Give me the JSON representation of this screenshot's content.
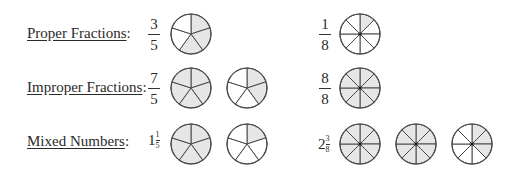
{
  "rows": [
    {
      "label": "Proper Fractions",
      "colon": ":",
      "left": {
        "type": "fraction",
        "numerator": "3",
        "denominator": "5",
        "pies": [
          {
            "slices": 5,
            "shaded": 3
          }
        ]
      },
      "right": {
        "type": "fraction",
        "numerator": "1",
        "denominator": "8",
        "pies": [
          {
            "slices": 8,
            "shaded": 1
          }
        ]
      }
    },
    {
      "label": "Improper Fractions",
      "colon": ":",
      "left": {
        "type": "fraction",
        "numerator": "7",
        "denominator": "5",
        "pies": [
          {
            "slices": 5,
            "shaded": 5
          },
          {
            "slices": 5,
            "shaded": 2
          }
        ]
      },
      "right": {
        "type": "fraction",
        "numerator": "8",
        "denominator": "8",
        "pies": [
          {
            "slices": 8,
            "shaded": 8
          }
        ]
      }
    },
    {
      "label": "Mixed Numbers",
      "colon": ":",
      "left": {
        "type": "mixed",
        "whole": "1",
        "numerator": "1",
        "denominator": "5",
        "pies": [
          {
            "slices": 5,
            "shaded": 5
          },
          {
            "slices": 5,
            "shaded": 1
          }
        ]
      },
      "right": {
        "type": "mixed",
        "whole": "2",
        "numerator": "3",
        "denominator": "8",
        "pies": [
          {
            "slices": 8,
            "shaded": 8
          },
          {
            "slices": 8,
            "shaded": 8
          },
          {
            "slices": 8,
            "shaded": 3
          }
        ]
      }
    }
  ],
  "colors": {
    "shaded": "#e6e6e6",
    "unshaded": "#ffffff",
    "stroke": "#4a4a4a"
  }
}
